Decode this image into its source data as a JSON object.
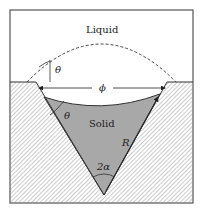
{
  "diagram": {
    "regions": {
      "liquid_label": "Liquid",
      "solid_label": "Solid"
    },
    "symbols": {
      "contact_angle_top": "θ",
      "contact_angle_solid": "θ",
      "diameter": "ϕ",
      "radius": "R",
      "groove_angle": "2α"
    },
    "colors": {
      "frame": "#555555",
      "solid_fill": "#a8a8a8",
      "hatch": "#9a9a9a",
      "line": "#333333",
      "background": "#ffffff"
    }
  }
}
